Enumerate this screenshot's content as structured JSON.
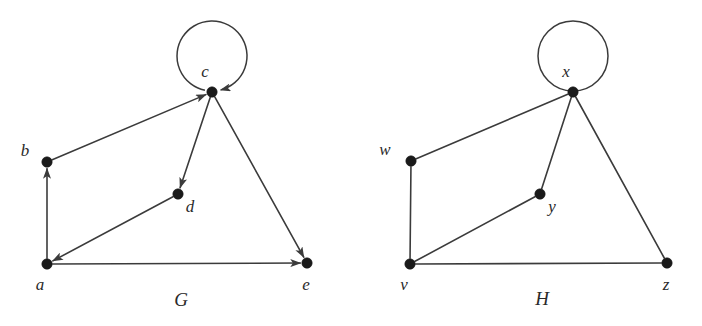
{
  "figure": {
    "background_color": "#ffffff",
    "ink_color": "#3b3b3b",
    "vertex_color": "#1a1a1a",
    "width": 702,
    "height": 326
  },
  "graphs": [
    {
      "name": "G",
      "name_label": "G",
      "name_pos": {
        "x": 181,
        "y": 306
      },
      "directed": true,
      "vertices": [
        {
          "id": "a",
          "label": "a",
          "x": 47,
          "y": 264,
          "label_x": 40,
          "label_y": 290
        },
        {
          "id": "b",
          "label": "b",
          "x": 47,
          "y": 162,
          "label_x": 25,
          "label_y": 156
        },
        {
          "id": "c",
          "label": "c",
          "x": 212,
          "y": 92,
          "label_x": 205,
          "label_y": 77
        },
        {
          "id": "d",
          "label": "d",
          "x": 178,
          "y": 194,
          "label_x": 190,
          "label_y": 212
        },
        {
          "id": "e",
          "label": "e",
          "x": 307,
          "y": 263,
          "label_x": 306,
          "label_y": 290
        }
      ],
      "edges": [
        {
          "from": "a",
          "to": "b",
          "arrow": true
        },
        {
          "from": "b",
          "to": "c",
          "arrow": true
        },
        {
          "from": "c",
          "to": "d",
          "arrow": true
        },
        {
          "from": "d",
          "to": "a",
          "arrow": true
        },
        {
          "from": "a",
          "to": "e",
          "arrow": true
        },
        {
          "from": "c",
          "to": "e",
          "arrow": true
        }
      ],
      "self_loops": [
        {
          "at": "c",
          "cx": 212,
          "cy": 56,
          "r": 35,
          "arrow": true
        }
      ]
    },
    {
      "name": "H",
      "name_label": "H",
      "name_pos": {
        "x": 542,
        "y": 305
      },
      "directed": false,
      "vertices": [
        {
          "id": "v",
          "label": "v",
          "x": 410,
          "y": 264,
          "label_x": 404,
          "label_y": 290
        },
        {
          "id": "w",
          "label": "w",
          "x": 411,
          "y": 161,
          "label_x": 385,
          "label_y": 155
        },
        {
          "id": "x",
          "label": "x",
          "x": 573,
          "y": 92,
          "label_x": 566,
          "label_y": 77
        },
        {
          "id": "y",
          "label": "y",
          "x": 540,
          "y": 194,
          "label_x": 552,
          "label_y": 212
        },
        {
          "id": "z",
          "label": "z",
          "x": 667,
          "y": 263,
          "label_x": 666,
          "label_y": 290
        }
      ],
      "edges": [
        {
          "from": "v",
          "to": "w",
          "arrow": false
        },
        {
          "from": "w",
          "to": "x",
          "arrow": false
        },
        {
          "from": "x",
          "to": "y",
          "arrow": false
        },
        {
          "from": "y",
          "to": "v",
          "arrow": false
        },
        {
          "from": "v",
          "to": "z",
          "arrow": false
        },
        {
          "from": "x",
          "to": "z",
          "arrow": false
        }
      ],
      "self_loops": [
        {
          "at": "x",
          "cx": 573,
          "cy": 56,
          "r": 35,
          "arrow": false
        }
      ]
    }
  ]
}
